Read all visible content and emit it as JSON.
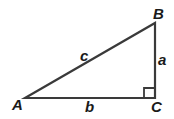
{
  "diagram": {
    "vertices": {
      "A": {
        "label": "A",
        "x": 25,
        "y": 98
      },
      "B": {
        "label": "B",
        "x": 155,
        "y": 23
      },
      "C": {
        "label": "C",
        "x": 155,
        "y": 98
      }
    },
    "sides": {
      "a": {
        "label": "a",
        "from": "B",
        "to": "C"
      },
      "b": {
        "label": "b",
        "from": "A",
        "to": "C"
      },
      "c": {
        "label": "c",
        "from": "A",
        "to": "B"
      }
    },
    "right_angle_at": "C",
    "colors": {
      "stroke": "#3a3a3a",
      "text": "#1a1a1a",
      "background": "#ffffff"
    }
  }
}
